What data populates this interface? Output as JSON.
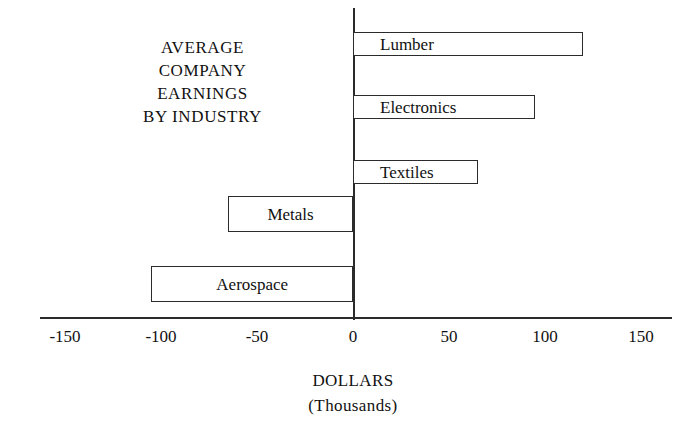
{
  "chart_data": {
    "type": "bar",
    "orientation": "horizontal",
    "title": "AVERAGE COMPANY EARNINGS BY INDUSTRY",
    "title_lines": [
      "AVERAGE",
      "COMPANY",
      "EARNINGS",
      "BY INDUSTRY"
    ],
    "categories": [
      "Lumber",
      "Electronics",
      "Textiles",
      "Metals",
      "Aerospace"
    ],
    "values": [
      120,
      95,
      65,
      -65,
      -105
    ],
    "xlabel": "DOLLARS",
    "xlabel_sub": "(Thousands)",
    "ylabel": "",
    "xlim": [
      -175,
      165
    ],
    "xticks": [
      -150,
      -100,
      -50,
      0,
      50,
      100,
      150
    ],
    "xtick_labels": [
      "-150",
      "-100",
      "-50",
      "0",
      "50",
      "100",
      "150"
    ],
    "grid": false,
    "legend": false,
    "bar_facecolor": "#ffffff",
    "bar_edgecolor": "#2b2b2b",
    "axis_color": "#2b2b2b",
    "background": "#ffffff",
    "bars": [
      {
        "label": "Lumber",
        "value": 120,
        "label_inside": true
      },
      {
        "label": "Electronics",
        "value": 95,
        "label_inside": true
      },
      {
        "label": "Textiles",
        "value": 65,
        "label_inside": true
      },
      {
        "label": "Metals",
        "value": -65,
        "label_inside": true
      },
      {
        "label": "Aerospace",
        "value": -105,
        "label_inside": true
      }
    ]
  }
}
